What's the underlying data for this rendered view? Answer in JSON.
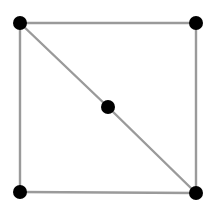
{
  "graph": {
    "type": "undirected",
    "edge_color": "#9a9a9a",
    "node_color": "#000000",
    "node_radius": 7,
    "nodes": [
      {
        "id": "top-left",
        "x": 20,
        "y": 23
      },
      {
        "id": "top-right",
        "x": 196,
        "y": 23
      },
      {
        "id": "bottom-left",
        "x": 20,
        "y": 192
      },
      {
        "id": "bottom-right",
        "x": 196,
        "y": 193
      },
      {
        "id": "center",
        "x": 108,
        "y": 107
      }
    ],
    "edges": [
      {
        "from": "top-left",
        "to": "top-right"
      },
      {
        "from": "top-right",
        "to": "bottom-right"
      },
      {
        "from": "bottom-right",
        "to": "bottom-left"
      },
      {
        "from": "bottom-left",
        "to": "top-left"
      },
      {
        "from": "top-left",
        "to": "center"
      },
      {
        "from": "center",
        "to": "bottom-right"
      }
    ]
  }
}
